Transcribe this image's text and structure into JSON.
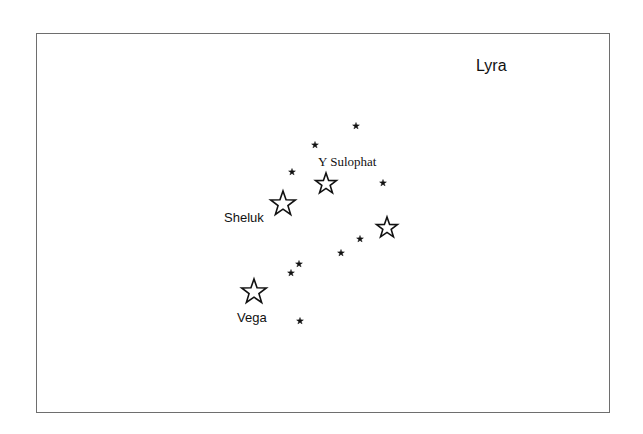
{
  "chart": {
    "title": "Lyra",
    "frame": {
      "left": 36,
      "top": 33,
      "right": 610,
      "bottom": 413,
      "border_color": "#6e6e6e"
    },
    "star_color": "#111111"
  },
  "labels": {
    "y_sulophat": "Y Sulophat",
    "sheluk": "Sheluk",
    "vega": "Vega"
  },
  "chart_data": {
    "type": "scatter",
    "title": "Lyra",
    "xlabel": "",
    "ylabel": "",
    "grid": false,
    "legend": "none",
    "points": [
      {
        "name": "Vega",
        "x": 254,
        "y": 292,
        "marker": "outline-star",
        "size": "large"
      },
      {
        "name": "Sheluk",
        "x": 283,
        "y": 204,
        "marker": "outline-star",
        "size": "large"
      },
      {
        "name": "Y Sulophat",
        "x": 326,
        "y": 184,
        "marker": "outline-star",
        "size": "medium"
      },
      {
        "name": "",
        "x": 387,
        "y": 228,
        "marker": "outline-star",
        "size": "medium"
      },
      {
        "name": "",
        "x": 356,
        "y": 126,
        "marker": "filled-star",
        "size": "small"
      },
      {
        "name": "",
        "x": 315,
        "y": 145,
        "marker": "filled-star",
        "size": "small"
      },
      {
        "name": "",
        "x": 292,
        "y": 172,
        "marker": "filled-star",
        "size": "small"
      },
      {
        "name": "",
        "x": 383,
        "y": 183,
        "marker": "filled-star",
        "size": "small"
      },
      {
        "name": "",
        "x": 360,
        "y": 239,
        "marker": "filled-star",
        "size": "small"
      },
      {
        "name": "",
        "x": 341,
        "y": 253,
        "marker": "filled-star",
        "size": "small"
      },
      {
        "name": "",
        "x": 299,
        "y": 264,
        "marker": "filled-star",
        "size": "small"
      },
      {
        "name": "",
        "x": 291,
        "y": 273,
        "marker": "filled-star",
        "size": "small"
      },
      {
        "name": "",
        "x": 300,
        "y": 321,
        "marker": "filled-star",
        "size": "small"
      }
    ],
    "annotations": [
      {
        "text": "Lyra",
        "x": 476,
        "y": 66
      },
      {
        "text": "Y Sulophat",
        "x": 320,
        "y": 162
      },
      {
        "text": "Sheluk",
        "x": 225,
        "y": 217
      },
      {
        "text": "Vega",
        "x": 237,
        "y": 318
      }
    ]
  }
}
